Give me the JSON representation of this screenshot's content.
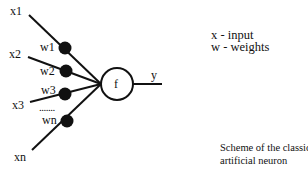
{
  "diagram": {
    "title": "Scheme of the classic artificial neuron",
    "colors": {
      "line": "#111111",
      "weight_dot": "#111111",
      "neuron_fill": "#ffffff",
      "background": "#ffffff"
    },
    "inputs": [
      {
        "label": "x1",
        "weight": "w1"
      },
      {
        "label": "x2",
        "weight": "w2"
      },
      {
        "label": "x3",
        "weight": "w3"
      },
      {
        "label": "xn",
        "weight": "wn"
      }
    ],
    "ellipsis": ".......",
    "neuron": {
      "label": "f"
    },
    "output": {
      "label": "y"
    },
    "legend": {
      "line1": "x - input",
      "line2": "w - weights"
    },
    "caption": {
      "line1": "Scheme of the classic",
      "line2": "artificial neuron"
    }
  }
}
